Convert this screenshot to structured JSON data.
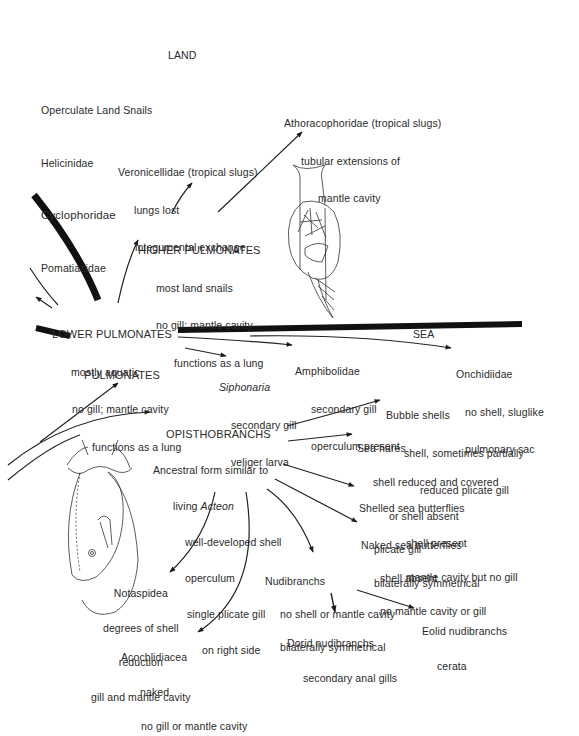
{
  "diagram": {
    "type": "phylogeny / evolutionary radiation of gastropods",
    "realm_labels": {
      "land": "LAND",
      "sea": "SEA"
    },
    "land_list": [
      "Operculate Land Snails",
      "Helicinidae",
      "Cyclophoridae",
      "Pomatiasidae"
    ],
    "nodes": {
      "veronicellidae": {
        "title": "Veronicellidae (tropical slugs)",
        "lines": [
          "lungs lost",
          "integumental exchange"
        ]
      },
      "athoracophoridae": {
        "title": "Athoracophoridae (tropical slugs)",
        "lines": [
          "tubular extensions of",
          "mantle cavity"
        ]
      },
      "higher_pulmonates": {
        "title": "HIGHER PULMONATES",
        "lines": [
          "most land snails",
          "no gill; mantle cavity",
          "functions as a lung"
        ]
      },
      "lower_pulmonates": {
        "title": "LOWER PULMONATES",
        "lines": [
          "mostly aquatic",
          "no gill; mantle cavity",
          "functions as a lung"
        ]
      },
      "siphonaria": {
        "title": "Siphonaria",
        "lines": [
          "secondary gill",
          "veliger larva"
        ]
      },
      "amphibolidae": {
        "title": "Amphibolidae",
        "lines": [
          "secondary gill",
          "operculum present"
        ]
      },
      "onchidiidae": {
        "title": "Onchidiidae",
        "lines": [
          "no shell, sluglike",
          "pulmonary sac"
        ]
      },
      "pulmonates": {
        "title": "PULMONATES"
      },
      "opisthobranchs": {
        "title": "OPISTHOBRANCHS",
        "lines": [
          "Ancestral form similar to",
          "living",
          "Acteon",
          "well-developed shell",
          "operculum",
          "single plicate gill",
          "on right side"
        ]
      },
      "bubble_shells": {
        "title": "Bubble shells",
        "lines": [
          "shell, sometimes partially",
          "reduced plicate gill"
        ]
      },
      "sea_hares": {
        "title": "Sea hares",
        "lines": [
          "shell reduced and covered",
          "or shell absent",
          "plicate gill",
          "bilaterally symmetrical"
        ]
      },
      "shelled_sea_butterflies": {
        "title": "Shelled sea butterflies",
        "lines": [
          "shell present",
          "mantle cavity but no gill"
        ]
      },
      "naked_sea_butterflies": {
        "title": "Naked sea butterflies",
        "lines": [
          "shell absent",
          "no mantle cavity or gill"
        ]
      },
      "nudibranchs": {
        "title": "Nudibranchs",
        "lines": [
          "no shell or mantle cavity",
          "bilaterally symmetrical"
        ]
      },
      "dorid_nudibranchs": {
        "title": "Dorid nudibranchs",
        "lines": [
          "secondary anal gills"
        ]
      },
      "eolid_nudibranchs": {
        "title": "Eolid nudibranchs",
        "lines": [
          "cerata"
        ]
      },
      "notaspidea": {
        "title": "Notaspidea",
        "lines": [
          "degrees of shell",
          "reduction",
          "gill and mantle cavity"
        ]
      },
      "acochlidiacea": {
        "title": "Acochlidiacea",
        "lines": [
          "naked",
          "no gill or mantle cavity"
        ]
      }
    },
    "illustrations": [
      "pulmonate-snail-drawing",
      "opisthobranch-acteon-drawing"
    ],
    "colors": {
      "ink": "#1a1a1a",
      "text": "#2a2a2a",
      "background": "#ffffff"
    }
  }
}
